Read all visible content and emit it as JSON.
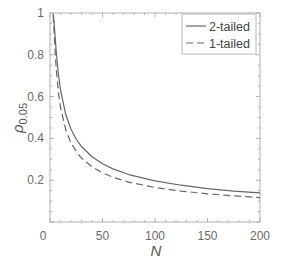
{
  "chart_data": {
    "type": "line",
    "title": "",
    "xlabel": "N",
    "ylabel": "ρ_0.05",
    "ylabel_main": "ρ",
    "ylabel_sub": "0.05",
    "xlim": [
      0,
      200
    ],
    "ylim": [
      0,
      1
    ],
    "xticks": [
      0,
      50,
      100,
      150,
      200
    ],
    "xtick_labels": [
      "0",
      "50",
      "100",
      "150",
      "200"
    ],
    "yticks": [
      0.2,
      0.4,
      0.6,
      0.8,
      1
    ],
    "ytick_labels": [
      "0.2",
      "0.4",
      "0.6",
      "0.8",
      "1"
    ],
    "grid": false,
    "legend_position": "upper right",
    "x": [
      3,
      4,
      5,
      6,
      8,
      10,
      15,
      20,
      25,
      30,
      40,
      50,
      60,
      75,
      100,
      125,
      150,
      175,
      200
    ],
    "series": [
      {
        "name": "2-tailed",
        "style": "solid",
        "color": "#666666",
        "values": [
          0.997,
          0.95,
          0.878,
          0.811,
          0.707,
          0.632,
          0.514,
          0.444,
          0.396,
          0.361,
          0.312,
          0.279,
          0.254,
          0.227,
          0.197,
          0.176,
          0.16,
          0.148,
          0.139
        ]
      },
      {
        "name": "1-tailed",
        "style": "dashed",
        "color": "#666666",
        "values": [
          0.988,
          0.9,
          0.805,
          0.729,
          0.621,
          0.549,
          0.441,
          0.378,
          0.337,
          0.306,
          0.264,
          0.235,
          0.214,
          0.191,
          0.165,
          0.148,
          0.135,
          0.125,
          0.117
        ]
      }
    ]
  }
}
